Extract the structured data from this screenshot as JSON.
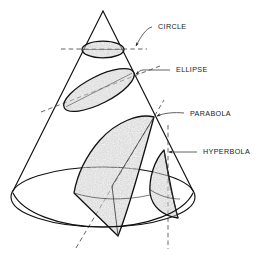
{
  "figure": {
    "background_color": "#ffffff",
    "line_color": "#111111",
    "shade_color": "#a8a8a8",
    "label_color": "#1a1a1a"
  },
  "labels": [
    {
      "id": "circle",
      "text": "CIRCLE",
      "x": 158,
      "y": 28,
      "anchor_x": 137,
      "anchor_y": 47
    },
    {
      "id": "ellipse",
      "text": "ELLIPSE",
      "x": 176,
      "y": 71,
      "anchor_x": 137,
      "anchor_y": 75
    },
    {
      "id": "parabola",
      "text": "PARABOLA",
      "x": 190,
      "y": 115,
      "anchor_x": 155,
      "anchor_y": 117
    },
    {
      "id": "hyperbola",
      "text": "HYPERBOLA",
      "x": 203,
      "y": 153,
      "anchor_x": 172,
      "anchor_y": 153
    }
  ],
  "cone": {
    "apex_x": 103,
    "apex_y": 11,
    "base_center_x": 103,
    "base_center_y": 197,
    "base_rx": 92,
    "base_ry": 30,
    "left_base_x": 13,
    "left_base_y": 191,
    "right_base_x": 193,
    "right_base_y": 191
  },
  "sections": [
    {
      "id": "circle-section",
      "name": "circle",
      "shaded": true,
      "cut": "horizontal"
    },
    {
      "id": "ellipse-section",
      "name": "ellipse",
      "shaded": true,
      "cut": "oblique"
    },
    {
      "id": "parabola-section",
      "name": "parabola",
      "shaded": true,
      "cut": "parallel-to-slant"
    },
    {
      "id": "hyperbola-section",
      "name": "hyperbola",
      "shaded": true,
      "cut": "vertical"
    }
  ]
}
